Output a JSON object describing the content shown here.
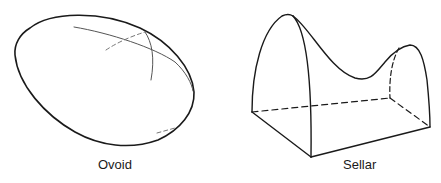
{
  "figure": {
    "panels": [
      {
        "id": "ovoid",
        "label": "Ovoid"
      },
      {
        "id": "sellar",
        "label": "Sellar"
      }
    ],
    "colors": {
      "outline": "#1a1a1a",
      "meridian": "#555555",
      "hidden": "#666666",
      "background": "#ffffff"
    }
  }
}
